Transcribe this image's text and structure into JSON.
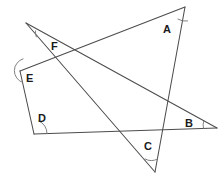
{
  "figure": {
    "canvas": {
      "width": 222,
      "height": 178
    },
    "stroke_color": "#4c4c4c",
    "arc_color": "#7a7a7a",
    "label_color": "#1a1a1a",
    "background_color": "#ffffff"
  },
  "vertices": [
    {
      "id": "A",
      "label": "A",
      "x": 185,
      "y": 7,
      "label_x": 163,
      "label_y": 24
    },
    {
      "id": "B",
      "label": "B",
      "x": 217,
      "y": 128,
      "label_x": 185,
      "label_y": 118
    },
    {
      "id": "C",
      "label": "C",
      "x": 155,
      "y": 172,
      "label_x": 144,
      "label_y": 141
    },
    {
      "id": "D",
      "label": "D",
      "x": 34,
      "y": 134,
      "label_x": 38,
      "label_y": 113
    },
    {
      "id": "E",
      "label": "E",
      "x": 20,
      "y": 71,
      "label_x": 26,
      "label_y": 73
    },
    {
      "id": "F",
      "label": "F",
      "x": 26,
      "y": 23,
      "label_x": 51,
      "label_y": 41
    }
  ],
  "segments": [
    {
      "id": "seg-E-A",
      "from": "E",
      "to": "A",
      "x1": 20,
      "y1": 71,
      "x2": 185,
      "y2": 7
    },
    {
      "id": "seg-F-B",
      "from": "F",
      "to": "B",
      "x1": 26,
      "y1": 23,
      "x2": 217,
      "y2": 128
    },
    {
      "id": "seg-F-C",
      "from": "F",
      "to": "C",
      "x1": 26,
      "y1": 23,
      "x2": 155,
      "y2": 172
    },
    {
      "id": "seg-A-C",
      "from": "A",
      "to": "C",
      "x1": 185,
      "y1": 7,
      "x2": 155,
      "y2": 172
    },
    {
      "id": "seg-D-B",
      "from": "D",
      "to": "B",
      "x1": 34,
      "y1": 134,
      "x2": 217,
      "y2": 128
    },
    {
      "id": "seg-E-D",
      "from": "E",
      "to": "D",
      "x1": 20,
      "y1": 71,
      "x2": 34,
      "y2": 134
    }
  ],
  "angle_arcs": [
    {
      "id": "arc-A",
      "at": "A",
      "d": "M 177.9 19.1 A 14 14 0 0 0 187.5 21.0"
    },
    {
      "id": "arc-B",
      "at": "B",
      "d": "M 203.6 121.3 A 14 14 0 0 0 203.5 128.5"
    },
    {
      "id": "arc-C",
      "at": "C",
      "d": "M 145.1 159.0 A 13 13 0 0 0 157.4 159.1"
    },
    {
      "id": "arc-D",
      "at": "D",
      "d": "M 38.8 121.0 A 13 13 0 0 1 47.0 133.6"
    },
    {
      "id": "arc-E",
      "at": "E",
      "d": "M 23.1 58.8 A 12.5 12.5 0 0 0 22.7 82.5"
    },
    {
      "id": "arc-F",
      "at": "F",
      "d": "M 35.5 30.9 A 12 12 0 0 0 36.3 36.9"
    }
  ]
}
